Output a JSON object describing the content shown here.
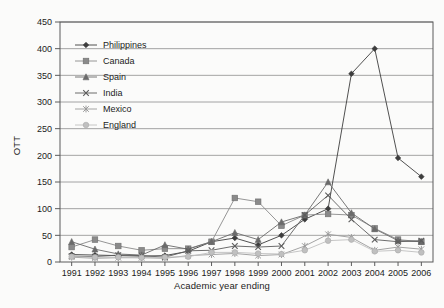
{
  "chart_data": {
    "type": "line",
    "title": "",
    "xlabel": "Academic year ending",
    "ylabel": "OTT",
    "categories": [
      "1991",
      "1992",
      "1993",
      "1994",
      "1995",
      "1996",
      "1997",
      "1998",
      "1999",
      "2000",
      "2001",
      "2002",
      "2003",
      "2004",
      "2005",
      "2006"
    ],
    "ylim": [
      0,
      450
    ],
    "ytick_step": 50,
    "yticks": [
      "0",
      "50",
      "100",
      "150",
      "200",
      "250",
      "300",
      "350",
      "400",
      "450"
    ],
    "grid": "horizontal",
    "legend_position": "upper-left-inside",
    "series": [
      {
        "name": "Philippines",
        "marker": "diamond",
        "color": "#3d3d3d",
        "values": [
          14,
          13,
          12,
          11,
          12,
          20,
          38,
          45,
          32,
          50,
          80,
          100,
          353,
          400,
          195,
          160
        ]
      },
      {
        "name": "Canada",
        "marker": "square",
        "color": "#8a8a8a",
        "values": [
          28,
          42,
          30,
          22,
          25,
          25,
          38,
          120,
          113,
          68,
          88,
          90,
          88,
          63,
          42,
          38
        ]
      },
      {
        "name": "Spain",
        "marker": "triangle",
        "color": "#6a6a6a",
        "values": [
          38,
          24,
          15,
          13,
          32,
          24,
          38,
          55,
          42,
          75,
          88,
          150,
          92,
          62,
          40,
          38
        ]
      },
      {
        "name": "India",
        "marker": "cross",
        "color": "#5c5c5c",
        "values": [
          11,
          10,
          13,
          12,
          9,
          21,
          22,
          30,
          28,
          30,
          88,
          125,
          80,
          42,
          38,
          40
        ]
      },
      {
        "name": "Mexico",
        "marker": "asterisk",
        "color": "#9a9a9a",
        "values": [
          9,
          7,
          8,
          8,
          7,
          12,
          14,
          16,
          12,
          14,
          30,
          52,
          46,
          22,
          28,
          24
        ]
      },
      {
        "name": "England",
        "marker": "circle",
        "color": "#c0c0c0",
        "values": [
          10,
          9,
          9,
          8,
          9,
          10,
          18,
          18,
          16,
          15,
          22,
          40,
          42,
          20,
          22,
          18
        ]
      }
    ]
  }
}
